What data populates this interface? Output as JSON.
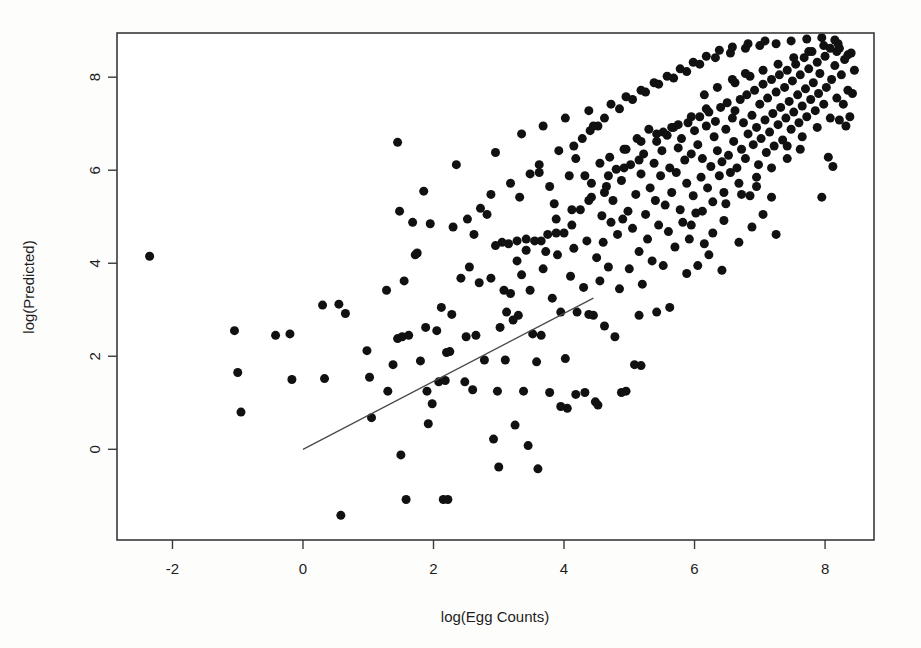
{
  "figure": {
    "background_color": "#fdfdfc",
    "plot_background_color": "#ffffff",
    "frame_color": "#3a3a3a",
    "point_color": "#111111",
    "line_color": "#4a4a4a"
  },
  "chart_data": {
    "type": "scatter",
    "title": "",
    "xlabel": "log(Egg Counts)",
    "ylabel": "log(Predicted)",
    "xlim": [
      -2.85,
      8.75
    ],
    "ylim": [
      -1.95,
      8.95
    ],
    "xticks": [
      -2,
      0,
      2,
      4,
      6,
      8
    ],
    "xticklabels": [
      "-2",
      "0",
      "2",
      "4",
      "6",
      "8"
    ],
    "yticks": [
      0,
      2,
      4,
      6,
      8
    ],
    "yticklabels": [
      "0",
      "2",
      "4",
      "6",
      "8"
    ],
    "grid": false,
    "legend": null,
    "marker": {
      "shape": "circle",
      "size_px": 9,
      "filled": true
    },
    "fit_line": {
      "type": "linear",
      "x_start": 0.0,
      "y_start": 0.0,
      "x_end": 4.45,
      "y_end": 3.25,
      "slope": 0.73,
      "intercept": 0.0
    },
    "points": [
      [
        -2.35,
        4.15
      ],
      [
        -1.05,
        2.55
      ],
      [
        -1.0,
        1.65
      ],
      [
        -0.95,
        0.8
      ],
      [
        -0.42,
        2.45
      ],
      [
        -0.2,
        2.48
      ],
      [
        -0.17,
        1.5
      ],
      [
        0.3,
        3.1
      ],
      [
        0.33,
        1.52
      ],
      [
        0.55,
        3.12
      ],
      [
        0.58,
        -1.42
      ],
      [
        0.65,
        2.92
      ],
      [
        0.98,
        2.12
      ],
      [
        1.02,
        1.55
      ],
      [
        1.05,
        0.68
      ],
      [
        1.28,
        3.42
      ],
      [
        1.3,
        1.25
      ],
      [
        1.38,
        1.82
      ],
      [
        1.45,
        2.38
      ],
      [
        1.45,
        6.6
      ],
      [
        1.48,
        5.12
      ],
      [
        1.5,
        -0.12
      ],
      [
        1.52,
        2.42
      ],
      [
        1.55,
        3.62
      ],
      [
        1.58,
        -1.08
      ],
      [
        1.62,
        2.45
      ],
      [
        1.68,
        4.88
      ],
      [
        1.72,
        4.18
      ],
      [
        1.75,
        4.22
      ],
      [
        1.8,
        1.9
      ],
      [
        1.85,
        5.55
      ],
      [
        1.88,
        2.62
      ],
      [
        1.9,
        1.25
      ],
      [
        1.92,
        0.55
      ],
      [
        1.95,
        4.85
      ],
      [
        1.98,
        0.98
      ],
      [
        2.05,
        2.55
      ],
      [
        2.08,
        1.45
      ],
      [
        2.12,
        3.05
      ],
      [
        2.15,
        -1.08
      ],
      [
        2.18,
        1.48
      ],
      [
        2.2,
        2.08
      ],
      [
        2.22,
        -1.08
      ],
      [
        2.25,
        2.1
      ],
      [
        2.28,
        2.9
      ],
      [
        2.3,
        4.78
      ],
      [
        2.35,
        6.12
      ],
      [
        2.42,
        3.68
      ],
      [
        2.48,
        1.45
      ],
      [
        2.5,
        2.42
      ],
      [
        2.55,
        3.92
      ],
      [
        2.6,
        1.28
      ],
      [
        2.62,
        4.62
      ],
      [
        2.65,
        2.45
      ],
      [
        2.7,
        3.58
      ],
      [
        2.78,
        1.92
      ],
      [
        2.82,
        5.05
      ],
      [
        2.88,
        3.68
      ],
      [
        2.92,
        0.22
      ],
      [
        2.95,
        6.38
      ],
      [
        2.98,
        1.25
      ],
      [
        3.0,
        -0.38
      ],
      [
        3.02,
        2.62
      ],
      [
        3.05,
        4.45
      ],
      [
        3.08,
        3.42
      ],
      [
        3.1,
        1.92
      ],
      [
        3.12,
        2.95
      ],
      [
        3.15,
        4.42
      ],
      [
        3.18,
        3.35
      ],
      [
        3.22,
        2.78
      ],
      [
        3.25,
        0.52
      ],
      [
        3.28,
        4.48
      ],
      [
        3.3,
        2.88
      ],
      [
        3.32,
        5.42
      ],
      [
        3.35,
        3.75
      ],
      [
        3.38,
        1.25
      ],
      [
        3.42,
        4.52
      ],
      [
        3.45,
        0.08
      ],
      [
        3.48,
        3.42
      ],
      [
        3.52,
        2.48
      ],
      [
        3.55,
        4.48
      ],
      [
        3.58,
        1.88
      ],
      [
        3.6,
        -0.42
      ],
      [
        3.62,
        5.95
      ],
      [
        3.65,
        2.45
      ],
      [
        3.68,
        3.88
      ],
      [
        3.72,
        4.25
      ],
      [
        3.75,
        4.62
      ],
      [
        3.78,
        1.22
      ],
      [
        3.82,
        3.25
      ],
      [
        3.85,
        5.28
      ],
      [
        3.9,
        4.18
      ],
      [
        3.95,
        2.95
      ],
      [
        4.0,
        4.65
      ],
      [
        4.02,
        1.95
      ],
      [
        4.05,
        0.88
      ],
      [
        4.08,
        5.88
      ],
      [
        4.1,
        3.72
      ],
      [
        4.15,
        4.32
      ],
      [
        4.18,
        6.25
      ],
      [
        4.2,
        2.95
      ],
      [
        4.25,
        5.15
      ],
      [
        4.3,
        3.48
      ],
      [
        4.32,
        1.22
      ],
      [
        4.35,
        4.48
      ],
      [
        4.38,
        2.9
      ],
      [
        4.4,
        6.85
      ],
      [
        4.42,
        5.42
      ],
      [
        4.45,
        2.88
      ],
      [
        4.48,
        1.02
      ],
      [
        4.5,
        4.12
      ],
      [
        4.52,
        6.95
      ],
      [
        4.55,
        3.62
      ],
      [
        4.58,
        5.02
      ],
      [
        4.6,
        4.45
      ],
      [
        4.62,
        2.65
      ],
      [
        4.65,
        5.65
      ],
      [
        4.68,
        3.92
      ],
      [
        4.7,
        6.28
      ],
      [
        4.72,
        4.88
      ],
      [
        4.75,
        5.35
      ],
      [
        4.78,
        2.42
      ],
      [
        4.8,
        6.02
      ],
      [
        4.82,
        4.62
      ],
      [
        4.85,
        3.45
      ],
      [
        4.88,
        5.78
      ],
      [
        4.9,
        4.95
      ],
      [
        4.92,
        6.45
      ],
      [
        4.95,
        1.25
      ],
      [
        4.98,
        5.12
      ],
      [
        5.0,
        3.88
      ],
      [
        5.02,
        6.12
      ],
      [
        5.05,
        4.75
      ],
      [
        5.08,
        1.82
      ],
      [
        5.1,
        5.48
      ],
      [
        5.12,
        6.68
      ],
      [
        5.15,
        4.25
      ],
      [
        5.18,
        5.92
      ],
      [
        5.2,
        3.55
      ],
      [
        5.22,
        6.35
      ],
      [
        5.25,
        5.05
      ],
      [
        5.28,
        4.52
      ],
      [
        5.3,
        6.88
      ],
      [
        5.32,
        5.62
      ],
      [
        5.35,
        4.05
      ],
      [
        5.38,
        6.15
      ],
      [
        5.4,
        5.35
      ],
      [
        5.42,
        6.62
      ],
      [
        5.45,
        4.82
      ],
      [
        5.48,
        5.88
      ],
      [
        5.5,
        6.42
      ],
      [
        5.52,
        3.95
      ],
      [
        5.55,
        5.25
      ],
      [
        5.58,
        6.75
      ],
      [
        5.6,
        4.68
      ],
      [
        5.62,
        6.05
      ],
      [
        5.65,
        5.52
      ],
      [
        5.68,
        6.92
      ],
      [
        5.7,
        4.35
      ],
      [
        5.72,
        5.95
      ],
      [
        5.75,
        6.48
      ],
      [
        5.78,
        5.15
      ],
      [
        5.8,
        6.68
      ],
      [
        5.82,
        4.88
      ],
      [
        5.85,
        6.22
      ],
      [
        5.88,
        5.72
      ],
      [
        5.9,
        7.02
      ],
      [
        5.92,
        4.52
      ],
      [
        5.95,
        6.35
      ],
      [
        5.98,
        5.45
      ],
      [
        6.0,
        6.85
      ],
      [
        6.02,
        5.08
      ],
      [
        6.05,
        6.55
      ],
      [
        6.08,
        7.15
      ],
      [
        6.1,
        5.85
      ],
      [
        6.12,
        6.25
      ],
      [
        6.15,
        4.42
      ],
      [
        6.18,
        6.95
      ],
      [
        6.2,
        5.62
      ],
      [
        6.22,
        7.25
      ],
      [
        6.25,
        6.08
      ],
      [
        6.28,
        5.32
      ],
      [
        6.3,
        6.72
      ],
      [
        6.32,
        7.05
      ],
      [
        6.35,
        6.42
      ],
      [
        6.38,
        5.88
      ],
      [
        6.4,
        7.35
      ],
      [
        6.42,
        6.18
      ],
      [
        6.45,
        5.52
      ],
      [
        6.48,
        6.88
      ],
      [
        6.5,
        7.45
      ],
      [
        6.52,
        6.32
      ],
      [
        6.55,
        5.95
      ],
      [
        6.58,
        7.12
      ],
      [
        6.6,
        6.62
      ],
      [
        6.62,
        7.28
      ],
      [
        6.65,
        6.05
      ],
      [
        6.68,
        5.72
      ],
      [
        6.7,
        7.52
      ],
      [
        6.72,
        6.45
      ],
      [
        6.75,
        7.02
      ],
      [
        6.78,
        6.25
      ],
      [
        6.8,
        7.62
      ],
      [
        6.82,
        6.78
      ],
      [
        6.85,
        5.45
      ],
      [
        6.88,
        7.18
      ],
      [
        6.9,
        6.55
      ],
      [
        6.92,
        7.72
      ],
      [
        6.95,
        6.92
      ],
      [
        6.98,
        6.12
      ],
      [
        7.0,
        7.42
      ],
      [
        7.02,
        6.68
      ],
      [
        7.05,
        7.85
      ],
      [
        7.08,
        7.08
      ],
      [
        7.1,
        6.38
      ],
      [
        7.12,
        7.55
      ],
      [
        7.15,
        6.82
      ],
      [
        7.18,
        7.95
      ],
      [
        7.2,
        7.22
      ],
      [
        7.22,
        6.52
      ],
      [
        7.25,
        7.68
      ],
      [
        7.28,
        6.98
      ],
      [
        7.3,
        8.05
      ],
      [
        7.32,
        7.35
      ],
      [
        7.35,
        6.65
      ],
      [
        7.38,
        7.78
      ],
      [
        7.4,
        7.12
      ],
      [
        7.42,
        8.15
      ],
      [
        7.45,
        7.48
      ],
      [
        7.48,
        6.88
      ],
      [
        7.5,
        7.92
      ],
      [
        7.52,
        7.25
      ],
      [
        7.55,
        8.28
      ],
      [
        7.58,
        7.62
      ],
      [
        7.6,
        7.02
      ],
      [
        7.62,
        8.05
      ],
      [
        7.65,
        7.38
      ],
      [
        7.68,
        8.42
      ],
      [
        7.7,
        7.75
      ],
      [
        7.72,
        7.15
      ],
      [
        7.75,
        8.18
      ],
      [
        7.78,
        7.52
      ],
      [
        7.8,
        8.55
      ],
      [
        7.82,
        7.88
      ],
      [
        7.85,
        7.28
      ],
      [
        7.88,
        8.32
      ],
      [
        7.9,
        7.65
      ],
      [
        7.92,
        8.08
      ],
      [
        7.95,
        5.42
      ],
      [
        7.98,
        7.42
      ],
      [
        8.0,
        8.45
      ],
      [
        8.02,
        7.78
      ],
      [
        8.05,
        6.28
      ],
      [
        8.08,
        8.62
      ],
      [
        8.1,
        7.95
      ],
      [
        8.12,
        6.08
      ],
      [
        8.15,
        8.25
      ],
      [
        8.18,
        7.55
      ],
      [
        8.2,
        8.72
      ],
      [
        8.22,
        7.08
      ],
      [
        8.25,
        8.05
      ],
      [
        8.28,
        7.42
      ],
      [
        8.3,
        8.38
      ],
      [
        8.32,
        6.95
      ],
      [
        8.35,
        7.72
      ],
      [
        8.38,
        7.15
      ],
      [
        8.4,
        8.52
      ],
      [
        4.15,
        6.52
      ],
      [
        4.28,
        6.68
      ],
      [
        4.45,
        6.95
      ],
      [
        4.62,
        7.12
      ],
      [
        4.85,
        7.32
      ],
      [
        5.05,
        7.52
      ],
      [
        5.25,
        7.68
      ],
      [
        5.45,
        7.85
      ],
      [
        5.68,
        7.98
      ],
      [
        5.88,
        8.12
      ],
      [
        6.08,
        8.28
      ],
      [
        6.32,
        8.42
      ],
      [
        6.55,
        8.52
      ],
      [
        6.78,
        8.62
      ],
      [
        7.0,
        8.68
      ],
      [
        7.25,
        8.72
      ],
      [
        7.48,
        8.78
      ],
      [
        7.72,
        8.82
      ],
      [
        7.95,
        8.85
      ],
      [
        8.15,
        8.8
      ],
      [
        3.62,
        6.12
      ],
      [
        3.92,
        6.42
      ],
      [
        4.32,
        5.88
      ],
      [
        4.55,
        6.15
      ],
      [
        2.88,
        5.48
      ],
      [
        3.18,
        5.72
      ],
      [
        3.48,
        5.92
      ],
      [
        3.78,
        5.65
      ],
      [
        5.15,
        2.88
      ],
      [
        5.42,
        2.95
      ],
      [
        5.62,
        3.05
      ],
      [
        5.18,
        1.8
      ],
      [
        4.88,
        1.22
      ],
      [
        4.52,
        0.95
      ],
      [
        4.18,
        1.18
      ],
      [
        3.95,
        0.92
      ],
      [
        5.95,
        4.82
      ],
      [
        6.12,
        5.12
      ],
      [
        6.28,
        4.65
      ],
      [
        6.45,
        4.92
      ],
      [
        6.68,
        4.45
      ],
      [
        6.88,
        4.78
      ],
      [
        7.05,
        5.05
      ],
      [
        7.25,
        4.62
      ],
      [
        5.88,
        3.78
      ],
      [
        6.05,
        3.95
      ],
      [
        6.22,
        4.18
      ],
      [
        6.42,
        3.85
      ],
      [
        4.72,
        7.42
      ],
      [
        4.95,
        7.58
      ],
      [
        5.18,
        7.72
      ],
      [
        5.38,
        7.88
      ],
      [
        5.58,
        8.02
      ],
      [
        5.78,
        8.18
      ],
      [
        5.98,
        8.32
      ],
      [
        6.18,
        8.45
      ],
      [
        6.38,
        8.58
      ],
      [
        6.58,
        8.65
      ],
      [
        6.82,
        8.72
      ],
      [
        7.08,
        8.78
      ],
      [
        3.35,
        6.78
      ],
      [
        3.68,
        6.95
      ],
      [
        4.02,
        7.12
      ],
      [
        4.38,
        7.28
      ],
      [
        2.52,
        4.95
      ],
      [
        2.72,
        5.18
      ],
      [
        2.95,
        4.38
      ],
      [
        3.28,
        4.05
      ],
      [
        6.62,
        7.88
      ],
      [
        6.85,
        8.02
      ],
      [
        7.05,
        8.15
      ],
      [
        7.28,
        8.28
      ],
      [
        7.52,
        8.42
      ],
      [
        7.75,
        8.55
      ],
      [
        7.98,
        8.68
      ],
      [
        8.18,
        8.55
      ],
      [
        6.15,
        7.62
      ],
      [
        6.35,
        7.78
      ],
      [
        6.58,
        7.95
      ],
      [
        6.78,
        8.08
      ],
      [
        5.52,
        6.82
      ],
      [
        5.75,
        6.98
      ],
      [
        5.95,
        7.15
      ],
      [
        6.18,
        7.32
      ],
      [
        4.95,
        6.45
      ],
      [
        5.18,
        6.62
      ],
      [
        5.42,
        6.78
      ],
      [
        5.65,
        6.92
      ],
      [
        4.42,
        5.72
      ],
      [
        4.68,
        5.88
      ],
      [
        4.92,
        6.05
      ],
      [
        5.15,
        6.22
      ],
      [
        3.88,
        4.95
      ],
      [
        4.12,
        5.15
      ],
      [
        4.38,
        5.35
      ],
      [
        4.62,
        5.52
      ],
      [
        3.42,
        4.28
      ],
      [
        3.65,
        4.48
      ],
      [
        3.88,
        4.65
      ],
      [
        4.12,
        4.82
      ],
      [
        7.42,
        6.52
      ],
      [
        7.65,
        6.72
      ],
      [
        7.88,
        6.92
      ],
      [
        8.08,
        7.12
      ],
      [
        6.95,
        5.85
      ],
      [
        7.18,
        6.05
      ],
      [
        7.42,
        6.25
      ],
      [
        7.62,
        6.45
      ],
      [
        6.48,
        5.28
      ],
      [
        6.72,
        5.48
      ],
      [
        6.95,
        5.65
      ],
      [
        7.18,
        5.42
      ],
      [
        8.22,
        8.62
      ],
      [
        8.35,
        8.48
      ],
      [
        8.42,
        7.65
      ],
      [
        8.45,
        8.15
      ]
    ]
  },
  "annotations": {
    "note": ""
  }
}
